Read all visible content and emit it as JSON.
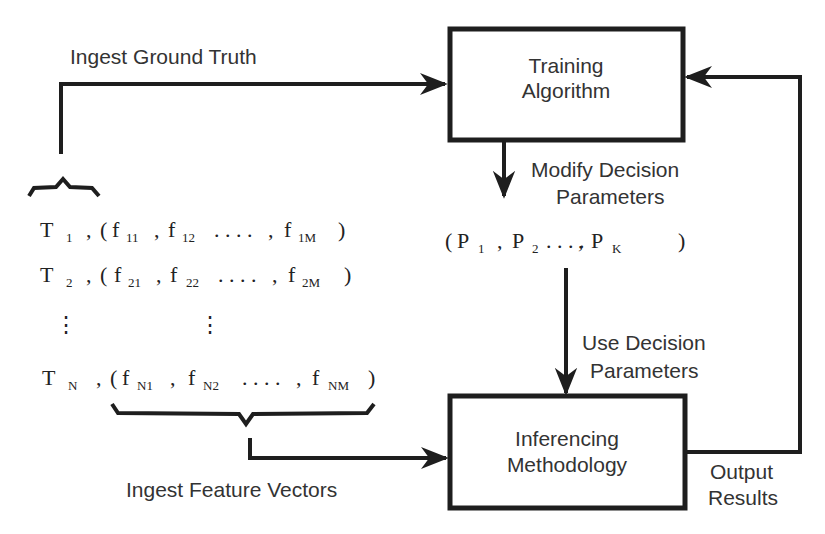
{
  "diagram": {
    "nodes": {
      "training": {
        "line1": "Training",
        "line2": "Algorithm"
      },
      "inferencing": {
        "line1": "Inferencing",
        "line2": "Methodology"
      }
    },
    "edge_labels": {
      "ground_truth": "Ingest Ground Truth",
      "modify_1": "Modify Decision",
      "modify_2": "Parameters",
      "use_1": "Use Decision",
      "use_2": "Parameters",
      "feature_vectors": "Ingest Feature Vectors",
      "output_1": "Output",
      "output_2": "Results"
    },
    "data_rows": [
      {
        "T": "T",
        "Tsub": "1",
        "f1": "f",
        "f1sub": "11",
        "f2": "f",
        "f2sub": "12",
        "fM": "f",
        "fMsub": "1M"
      },
      {
        "T": "T",
        "Tsub": "2",
        "f1": "f",
        "f1sub": "21",
        "f2": "f",
        "f2sub": "22",
        "fM": "f",
        "fMsub": "2M"
      },
      {
        "T": "T",
        "Tsub": "N",
        "f1": "f",
        "f1sub": "N1",
        "f2": "f",
        "f2sub": "N2",
        "fM": "f",
        "fMsub": "NM"
      }
    ],
    "vdots": "⋮",
    "params": {
      "p1": "P",
      "p1sub": "1",
      "p2": "P",
      "p2sub": "2",
      "pk": "P",
      "pksub": "K"
    },
    "punct": {
      "open": "(",
      "close": ")",
      "comma": ",",
      "ellipsis": ". . . ."
    }
  }
}
